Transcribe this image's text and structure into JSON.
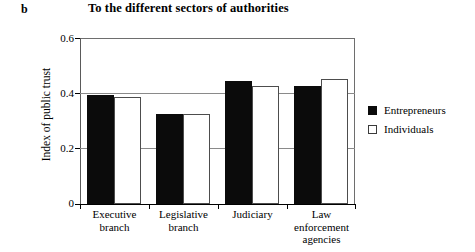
{
  "panel_label": "b",
  "legend": {
    "position": "right",
    "entries": [
      {
        "label": "Entrepreneurs",
        "swatch": "black"
      },
      {
        "label": "Individuals",
        "swatch": "white"
      }
    ]
  },
  "axis": {
    "y_title": "Index of public trust",
    "y_ticks": [
      "0.6",
      "0.4",
      "0.2",
      "0"
    ]
  },
  "chart_data": {
    "type": "bar",
    "title": "To the different sectors of authorities",
    "xlabel": "",
    "ylabel": "Index of public trust",
    "ylim": [
      0,
      0.6
    ],
    "ytick_values": [
      0,
      0.2,
      0.4,
      0.6
    ],
    "grid": "horizontal gridlines at 0.2 and 0.4",
    "legend_position": "right",
    "categories": [
      "Executive branch",
      "Legislative branch",
      "Judiciary",
      "Law enforcement agencies"
    ],
    "category_lines": [
      [
        "Executive",
        "branch"
      ],
      [
        "Legislative",
        "branch"
      ],
      [
        "Judiciary"
      ],
      [
        "Law",
        "enforcement",
        "agencies"
      ]
    ],
    "series": [
      {
        "name": "Entrepreneurs",
        "color": "#0b0b0b",
        "values": [
          0.395,
          0.325,
          0.445,
          0.425
        ]
      },
      {
        "name": "Individuals",
        "color": "#ffffff",
        "values": [
          0.385,
          0.325,
          0.425,
          0.45
        ]
      }
    ]
  }
}
